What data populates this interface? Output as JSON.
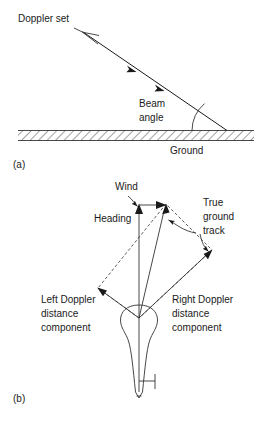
{
  "figure": {
    "panels": [
      {
        "id": "a",
        "caption": "(a)",
        "labels": {
          "doppler_set": "Doppler set",
          "beam_angle_line1": "Beam",
          "beam_angle_line2": "angle",
          "ground": "Ground"
        }
      },
      {
        "id": "b",
        "caption": "(b)",
        "labels": {
          "wind": "Wind",
          "heading": "Heading",
          "true_track_line1": "True",
          "true_track_line2": "ground",
          "true_track_line3": "track",
          "left_doppler_line1": "Left Doppler",
          "left_doppler_line2": "distance",
          "left_doppler_line3": "component",
          "right_doppler_line1": "Right Doppler",
          "right_doppler_line2": "distance",
          "right_doppler_line3": "component"
        }
      }
    ],
    "colors": {
      "ink": "#1a1a1a",
      "line": "#333333",
      "background": "#ffffff"
    }
  }
}
